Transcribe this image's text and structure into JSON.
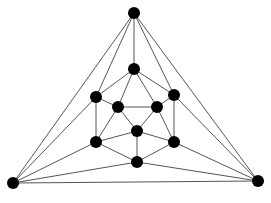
{
  "diagram": {
    "type": "graph",
    "colors": {
      "node": "#000000",
      "edge": "#555555",
      "background": "#ffffff"
    },
    "node_radius": 6,
    "nodes": [
      {
        "id": "T",
        "x": 134,
        "y": 13
      },
      {
        "id": "BL",
        "x": 13,
        "y": 183
      },
      {
        "id": "BR",
        "x": 258,
        "y": 181
      },
      {
        "id": "A",
        "x": 134,
        "y": 69
      },
      {
        "id": "L",
        "x": 96,
        "y": 97
      },
      {
        "id": "R",
        "x": 174,
        "y": 95
      },
      {
        "id": "IL",
        "x": 118,
        "y": 107
      },
      {
        "id": "IR",
        "x": 157,
        "y": 107
      },
      {
        "id": "C",
        "x": 137,
        "y": 131
      },
      {
        "id": "LL",
        "x": 96,
        "y": 142
      },
      {
        "id": "LR",
        "x": 174,
        "y": 142
      },
      {
        "id": "B",
        "x": 137,
        "y": 162
      }
    ],
    "edges": [
      [
        "T",
        "BL"
      ],
      [
        "T",
        "BR"
      ],
      [
        "BL",
        "BR"
      ],
      [
        "T",
        "A"
      ],
      [
        "T",
        "L"
      ],
      [
        "T",
        "R"
      ],
      [
        "BL",
        "L"
      ],
      [
        "BL",
        "LL"
      ],
      [
        "BL",
        "B"
      ],
      [
        "BR",
        "R"
      ],
      [
        "BR",
        "LR"
      ],
      [
        "BR",
        "B"
      ],
      [
        "A",
        "L"
      ],
      [
        "A",
        "R"
      ],
      [
        "A",
        "IL"
      ],
      [
        "A",
        "IR"
      ],
      [
        "L",
        "IL"
      ],
      [
        "L",
        "LL"
      ],
      [
        "R",
        "IR"
      ],
      [
        "R",
        "LR"
      ],
      [
        "IL",
        "IR"
      ],
      [
        "IL",
        "C"
      ],
      [
        "IR",
        "C"
      ],
      [
        "IL",
        "LL"
      ],
      [
        "C",
        "LL"
      ],
      [
        "C",
        "B"
      ],
      [
        "C",
        "LR"
      ],
      [
        "LL",
        "B"
      ],
      [
        "LR",
        "B"
      ],
      [
        "IR",
        "LR"
      ]
    ]
  }
}
